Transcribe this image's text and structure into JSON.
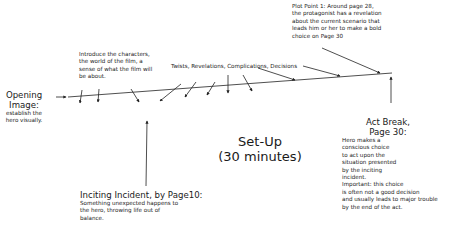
{
  "diagram": {
    "opening_image": {
      "title_line1": "Opening",
      "title_line2": "Image:",
      "desc_line1": "establish the",
      "desc_line2": "hero visually."
    },
    "introduce": {
      "line1": "Introduce the characters,",
      "line2": "the world of the film, a",
      "line3": "sense of what the film will",
      "line4": "be about."
    },
    "twists": {
      "label": "Twists, Revelations, Complications, Decisions"
    },
    "plot_point": {
      "line1": "Plot Point 1: Around page 28,",
      "line2": "the protagonist has a revelation",
      "line3": "about the current scenario that",
      "line4": "leads him or her to make a bold",
      "line5": "choice on Page 30"
    },
    "setup": {
      "title": "Set-Up",
      "subtitle": "(30 minutes)"
    },
    "inciting": {
      "title": "Inciting Incident, by Page10:",
      "line1": "Something unexpected happens to",
      "line2": "the hero, throwing life out of",
      "line3": "balance."
    },
    "act_break": {
      "title_line1": "Act Break,",
      "title_line2": "Page 30:",
      "lines": [
        "Hero makes a",
        "conscious choice",
        "to act upon the",
        "situation presented",
        "by the inciting",
        "incident.",
        "Important: this choice",
        "is often not a good decision",
        "and usually leads to major trouble",
        "by the end of the act."
      ]
    }
  }
}
